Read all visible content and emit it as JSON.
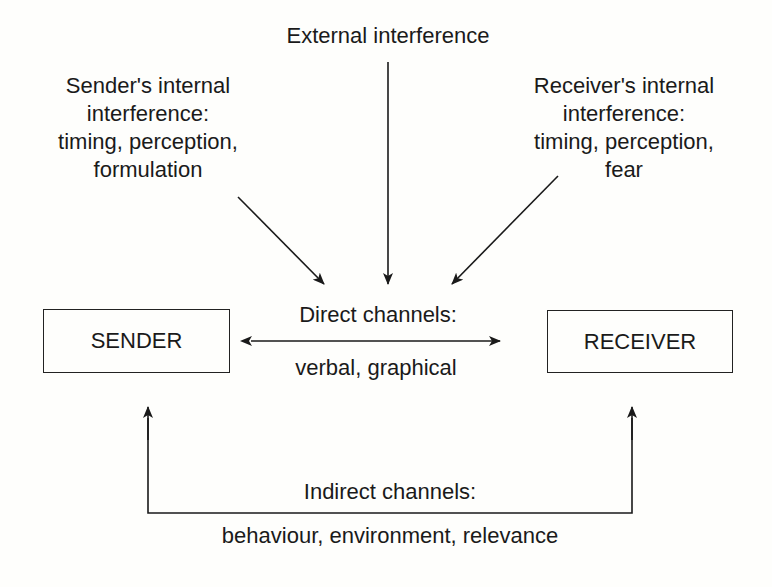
{
  "diagram": {
    "nodes": {
      "sender": {
        "label": "SENDER"
      },
      "receiver": {
        "label": "RECEIVER"
      }
    },
    "labels": {
      "external": {
        "lines": [
          "External interference"
        ]
      },
      "sender_internal": {
        "lines": [
          "Sender's internal",
          "interference:",
          "timing, perception,",
          "formulation"
        ]
      },
      "receiver_internal": {
        "lines": [
          "Receiver's internal",
          "interference:",
          "timing, perception,",
          "fear"
        ]
      },
      "direct_title": "Direct channels:",
      "direct_items": "verbal, graphical",
      "indirect_title": "Indirect channels:",
      "indirect_items": "behaviour, environment, relevance"
    },
    "edges": [
      {
        "from": "sender-internal-interference",
        "to": "direct-channels",
        "type": "arrow"
      },
      {
        "from": "external-interference",
        "to": "direct-channels",
        "type": "arrow"
      },
      {
        "from": "receiver-internal-interference",
        "to": "direct-channels",
        "type": "arrow"
      },
      {
        "from": "sender",
        "to": "receiver",
        "type": "bidirectional",
        "label": "Direct channels"
      },
      {
        "from": "indirect-channels",
        "to": "sender",
        "type": "arrow"
      },
      {
        "from": "indirect-channels",
        "to": "receiver",
        "type": "arrow"
      }
    ],
    "colors": {
      "ink": "#1a1a1a",
      "background": "#fefefc"
    }
  }
}
